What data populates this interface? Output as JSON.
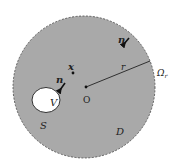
{
  "diagram": {
    "type": "domain-with-hole",
    "colors": {
      "domain_fill": "#a9a9a9",
      "hole_fill": "#ffffff",
      "stroke": "#333333",
      "background": "#ffffff"
    },
    "labels": {
      "outer_boundary": "Ω",
      "outer_boundary_sub": "r",
      "radius": "r",
      "origin": "O",
      "point": "x",
      "normal_outer": "n",
      "normal_inner": "n",
      "hole": "V",
      "hole_boundary": "S",
      "domain": "D"
    }
  }
}
